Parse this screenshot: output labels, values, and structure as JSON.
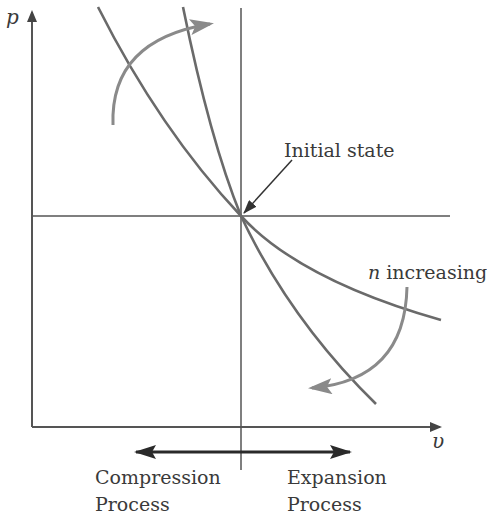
{
  "diagram": {
    "axes": {
      "y_label": "p",
      "x_label": "υ"
    },
    "annotations": {
      "initial_state": "Initial state",
      "n_symbol": "n",
      "n_increasing_rest": " increasing"
    },
    "process_labels": {
      "compression_line1": "Compression",
      "compression_line2": "Process",
      "expansion_line1": "Expansion",
      "expansion_line2": "Process"
    },
    "colors": {
      "axis": "#555555",
      "curve": "#6a6a6a",
      "arrow": "#8a8a8a",
      "text": "#3a3a3a",
      "double_arrow": "#2a2a2a"
    }
  }
}
